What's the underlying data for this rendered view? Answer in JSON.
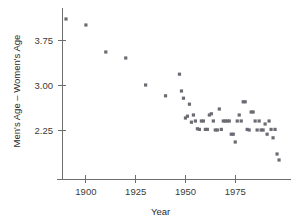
{
  "chart_data": {
    "type": "scatter",
    "title": "",
    "xlabel": "Year",
    "ylabel": "Men's Age – Women's Age",
    "xlim": [
      1888,
      2002
    ],
    "ylim": [
      1.55,
      4.25
    ],
    "xticks": [
      1900,
      1925,
      1950,
      1975
    ],
    "xticklabels": [
      "1900",
      "1925",
      "1950",
      "1975"
    ],
    "yticks": [
      2.25,
      3.0,
      3.75
    ],
    "yticklabels": [
      "2.25",
      "3.00",
      "3.75"
    ],
    "grid": false,
    "legend": null,
    "marker_color": "#6b6b73",
    "axis_color": "#6e6e6e",
    "series": [
      {
        "name": "Men's Age minus Women's Age at first marriage",
        "points": [
          [
            1890,
            4.1
          ],
          [
            1900,
            4.0
          ],
          [
            1910,
            3.55
          ],
          [
            1920,
            3.45
          ],
          [
            1930,
            3.0
          ],
          [
            1940,
            2.82
          ],
          [
            1947,
            3.18
          ],
          [
            1948,
            2.9
          ],
          [
            1949,
            2.78
          ],
          [
            1950,
            2.45
          ],
          [
            1951,
            2.48
          ],
          [
            1952,
            2.68
          ],
          [
            1953,
            2.38
          ],
          [
            1954,
            2.5
          ],
          [
            1955,
            2.4
          ],
          [
            1956,
            2.27
          ],
          [
            1957,
            2.26
          ],
          [
            1958,
            2.4
          ],
          [
            1959,
            2.4
          ],
          [
            1960,
            2.26
          ],
          [
            1961,
            2.26
          ],
          [
            1962,
            2.5
          ],
          [
            1963,
            2.52
          ],
          [
            1964,
            2.4
          ],
          [
            1965,
            2.25
          ],
          [
            1966,
            2.25
          ],
          [
            1967,
            2.6
          ],
          [
            1968,
            2.26
          ],
          [
            1969,
            2.4
          ],
          [
            1970,
            2.4
          ],
          [
            1971,
            2.4
          ],
          [
            1972,
            2.4
          ],
          [
            1973,
            2.18
          ],
          [
            1974,
            2.18
          ],
          [
            1975,
            2.05
          ],
          [
            1976,
            2.4
          ],
          [
            1977,
            2.5
          ],
          [
            1978,
            2.4
          ],
          [
            1979,
            2.72
          ],
          [
            1980,
            2.72
          ],
          [
            1981,
            2.26
          ],
          [
            1982,
            2.25
          ],
          [
            1983,
            2.55
          ],
          [
            1984,
            2.55
          ],
          [
            1985,
            2.4
          ],
          [
            1986,
            2.25
          ],
          [
            1987,
            2.4
          ],
          [
            1988,
            2.25
          ],
          [
            1989,
            2.25
          ],
          [
            1990,
            2.35
          ],
          [
            1991,
            2.18
          ],
          [
            1992,
            2.4
          ],
          [
            1993,
            2.26
          ],
          [
            1994,
            2.12
          ],
          [
            1995,
            2.26
          ],
          [
            1996,
            1.85
          ],
          [
            1997,
            1.75
          ]
        ]
      }
    ]
  }
}
